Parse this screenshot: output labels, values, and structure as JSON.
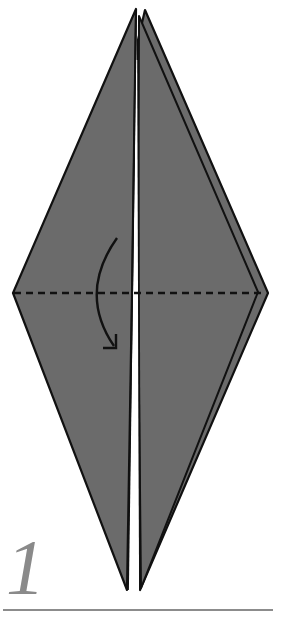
{
  "diagram": {
    "type": "origami-fold-step",
    "step_number": "1",
    "instruction": "valley-fold top down along horizontal center line",
    "colors": {
      "paper": "#6b6b6b",
      "outline": "#111111",
      "background": "#ffffff",
      "step_number": "#8a8a8a",
      "baseline": "#8c8c8c"
    },
    "shapes": {
      "back_layer": [
        [
          145,
          10
        ],
        [
          268,
          293
        ],
        [
          140,
          590
        ],
        [
          138,
          293
        ]
      ],
      "right_front_panel": [
        [
          140,
          14
        ],
        [
          258,
          292
        ],
        [
          140,
          588
        ]
      ],
      "left_panel": [
        [
          136,
          9
        ],
        [
          131,
          293
        ],
        [
          127,
          590
        ],
        [
          13,
          293
        ]
      ],
      "valley_fold_line": {
        "from": [
          13,
          293
        ],
        "to": [
          266,
          293
        ],
        "style": "dashed"
      },
      "fold_arrow": {
        "start": [
          117,
          238
        ],
        "control": [
          78,
          293
        ],
        "end": [
          116,
          348
        ],
        "direction": "down"
      }
    }
  }
}
